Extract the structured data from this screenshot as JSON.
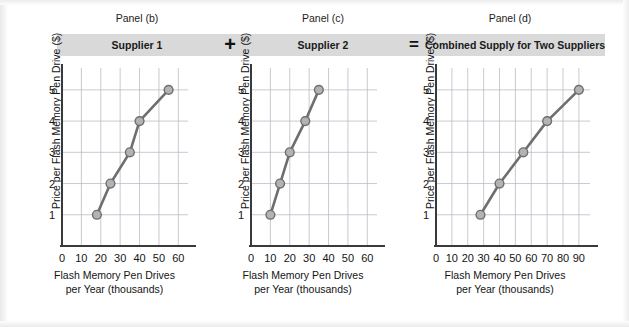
{
  "figure": {
    "background_color": "#ffffff",
    "band_color": "#d9d9d9",
    "line_color": "#6e6e6e",
    "marker_fill": "#b3b3b3",
    "marker_stroke": "#6e6e6e",
    "grid_color": "#b9bcc4",
    "axis_color": "#3a3a3a"
  },
  "captions": {
    "panel_b": "Panel (b)",
    "panel_c": "Panel (c)",
    "panel_d": "Panel (d)"
  },
  "bands": {
    "supplier1": "Supplier 1",
    "supplier2": "Supplier 2",
    "combined": "Combined Supply for Two Suppliers",
    "plus": "+",
    "equals": "="
  },
  "axis_labels": {
    "y": "Price per Flash Memory Pen Drive ($)",
    "x_line1": "Flash Memory Pen Drives",
    "x_line2": "per Year (thousands)"
  },
  "chart_data": [
    {
      "type": "line",
      "title": "Supplier 1",
      "panel": "Panel (b)",
      "xlabel": "Flash Memory Pen Drives per Year (thousands)",
      "ylabel": "Price per Flash Memory Pen Drive ($)",
      "x": [
        18,
        25,
        35,
        40,
        55
      ],
      "y": [
        1,
        2,
        3,
        4,
        5
      ],
      "xlim": [
        0,
        65
      ],
      "ylim": [
        0,
        5.7
      ],
      "xticks": [
        0,
        10,
        20,
        30,
        40,
        50,
        60
      ],
      "xticklabels": [
        "0",
        "10",
        "20",
        "30",
        "40",
        "50",
        "60"
      ],
      "yticks": [
        1,
        2,
        3,
        4,
        5
      ],
      "yticklabels": [
        "1",
        "2",
        "3",
        "4",
        "5"
      ],
      "grid": true,
      "legend": "none",
      "markers": "circle"
    },
    {
      "type": "line",
      "title": "Supplier 2",
      "panel": "Panel (c)",
      "xlabel": "Flash Memory Pen Drives per Year (thousands)",
      "ylabel": "Price per Flash Memory Pen Drive ($)",
      "x": [
        10,
        15,
        20,
        28,
        35
      ],
      "y": [
        1,
        2,
        3,
        4,
        5
      ],
      "xlim": [
        0,
        65
      ],
      "ylim": [
        0,
        5.7
      ],
      "xticks": [
        0,
        10,
        20,
        30,
        40,
        50,
        60
      ],
      "xticklabels": [
        "0",
        "10",
        "20",
        "30",
        "40",
        "50",
        "60"
      ],
      "yticks": [
        1,
        2,
        3,
        4,
        5
      ],
      "yticklabels": [
        "1",
        "2",
        "3",
        "4",
        "5"
      ],
      "grid": true,
      "legend": "none",
      "markers": "circle"
    },
    {
      "type": "line",
      "title": "Combined Supply for Two Suppliers",
      "panel": "Panel (d)",
      "xlabel": "Flash Memory Pen Drives per Year (thousands)",
      "ylabel": "Price per Flash Memory Pen Drive ($)",
      "x": [
        28,
        40,
        55,
        70,
        90
      ],
      "y": [
        1,
        2,
        3,
        4,
        5
      ],
      "xlim": [
        0,
        97
      ],
      "ylim": [
        0,
        5.7
      ],
      "xticks": [
        0,
        10,
        20,
        30,
        40,
        50,
        60,
        70,
        80,
        90
      ],
      "xticklabels": [
        "0",
        "10",
        "20",
        "30",
        "40",
        "50",
        "60",
        "70",
        "80",
        "90"
      ],
      "yticks": [
        1,
        2,
        3,
        4,
        5
      ],
      "yticklabels": [
        "1",
        "2",
        "3",
        "4",
        "5"
      ],
      "grid": true,
      "legend": "none",
      "markers": "circle"
    }
  ]
}
